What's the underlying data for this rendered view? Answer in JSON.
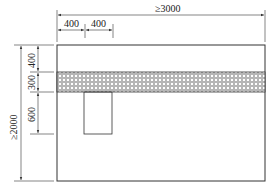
{
  "diagram": {
    "type": "dimensioned layout drawing",
    "colors": {
      "line": "#333333",
      "hatch_fill": "#9a9a9a",
      "background": "#ffffff"
    },
    "dimensions": {
      "total_width": "≥3000",
      "offset_1": "400",
      "offset_2": "400",
      "total_height": "≥2000",
      "top_gap": "400",
      "band_height": "300",
      "lower_rect_height": "600"
    },
    "elements": {
      "outer_rect": "outer boundary",
      "hatched_band": "cross-hatched horizontal band",
      "inner_rect": "small rectangle below band"
    }
  }
}
